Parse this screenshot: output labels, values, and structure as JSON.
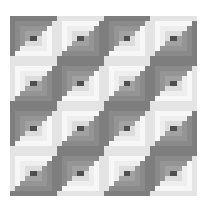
{
  "image": {
    "subject": "Log cabin quilt pattern",
    "grid": {
      "rows": 4,
      "cols": 4
    },
    "blocks": [
      [
        "D",
        "L",
        "D",
        "L"
      ],
      [
        "L",
        "D",
        "L",
        "D"
      ],
      [
        "D",
        "L",
        "D",
        "L"
      ],
      [
        "L",
        "D",
        "L",
        "D"
      ]
    ],
    "palette": {
      "background": "#ffffff",
      "center": "#4f4f4f",
      "dark": [
        "#a2a2a2",
        "#959595",
        "#8a8a8a",
        "#7e7e7e"
      ],
      "light": [
        "#dcdcdc",
        "#eeeeee",
        "#f7f7f7",
        "#e4e4e4"
      ]
    }
  }
}
